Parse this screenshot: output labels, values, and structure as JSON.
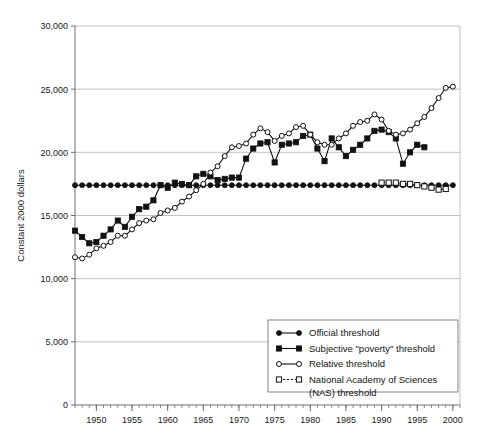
{
  "chart_data": {
    "type": "line",
    "title": "",
    "xlabel": "",
    "ylabel": "Constant 2000 dollars",
    "xlim": [
      1947,
      2001
    ],
    "ylim": [
      0,
      30000
    ],
    "grid": true,
    "legend_position": "bottom-right",
    "y_ticks": [
      0,
      5000,
      10000,
      15000,
      20000,
      25000,
      30000
    ],
    "y_tick_labels": [
      "0",
      "5,000",
      "10,000",
      "15,000",
      "20,000",
      "25,000",
      "30,000"
    ],
    "x_ticks": [
      1950,
      1955,
      1960,
      1965,
      1970,
      1975,
      1980,
      1985,
      1990,
      1995,
      2000
    ],
    "x_tick_labels": [
      "1950",
      "1955",
      "1960",
      "1965",
      "1970",
      "1975",
      "1980",
      "1985",
      "1990",
      "1995",
      "2000"
    ],
    "x_minor_tick_step": 1,
    "series": [
      {
        "name": "Official threshold",
        "marker": "filled-circle",
        "line_style": "solid",
        "color": "#111111",
        "x": [
          1947,
          1948,
          1949,
          1950,
          1951,
          1952,
          1953,
          1954,
          1955,
          1956,
          1957,
          1958,
          1959,
          1960,
          1961,
          1962,
          1963,
          1964,
          1965,
          1966,
          1967,
          1968,
          1969,
          1970,
          1971,
          1972,
          1973,
          1974,
          1975,
          1976,
          1977,
          1978,
          1979,
          1980,
          1981,
          1982,
          1983,
          1984,
          1985,
          1986,
          1987,
          1988,
          1989,
          1990,
          1991,
          1992,
          1993,
          1994,
          1995,
          1996,
          1997,
          1998,
          1999,
          2000
        ],
        "y": [
          17400,
          17400,
          17400,
          17400,
          17400,
          17400,
          17400,
          17400,
          17400,
          17400,
          17400,
          17400,
          17400,
          17400,
          17400,
          17400,
          17400,
          17400,
          17400,
          17400,
          17400,
          17400,
          17400,
          17400,
          17400,
          17400,
          17400,
          17400,
          17400,
          17400,
          17400,
          17400,
          17400,
          17400,
          17400,
          17400,
          17400,
          17400,
          17400,
          17400,
          17400,
          17400,
          17400,
          17400,
          17400,
          17400,
          17400,
          17400,
          17400,
          17400,
          17400,
          17400,
          17400,
          17400
        ]
      },
      {
        "name": "Subjective \"poverty\" threshold",
        "marker": "filled-square",
        "line_style": "solid",
        "color": "#111111",
        "x": [
          1947,
          1948,
          1949,
          1950,
          1951,
          1952,
          1953,
          1954,
          1955,
          1956,
          1957,
          1958,
          1959,
          1960,
          1961,
          1962,
          1963,
          1964,
          1965,
          1966,
          1967,
          1968,
          1969,
          1970,
          1971,
          1972,
          1973,
          1974,
          1975,
          1976,
          1977,
          1978,
          1979,
          1980,
          1981,
          1982,
          1983,
          1984,
          1985,
          1986,
          1987,
          1988,
          1989,
          1990,
          1991,
          1992,
          1993,
          1994,
          1995,
          1996
        ],
        "y": [
          13800,
          13300,
          12800,
          12900,
          13400,
          13900,
          14600,
          14100,
          14900,
          15500,
          15700,
          16200,
          17400,
          17200,
          17600,
          17500,
          17400,
          18100,
          18300,
          18100,
          17800,
          17900,
          18000,
          18000,
          19500,
          20300,
          20700,
          20800,
          19200,
          20600,
          20700,
          20800,
          21300,
          21400,
          20300,
          19300,
          21100,
          20400,
          19700,
          20200,
          20600,
          21100,
          21700,
          21800,
          21600,
          21100,
          19100,
          20000,
          20600,
          20400
        ]
      },
      {
        "name": "Relative threshold",
        "marker": "open-circle",
        "line_style": "solid",
        "color": "#111111",
        "x": [
          1947,
          1948,
          1949,
          1950,
          1951,
          1952,
          1953,
          1954,
          1955,
          1956,
          1957,
          1958,
          1959,
          1960,
          1961,
          1962,
          1963,
          1964,
          1965,
          1966,
          1967,
          1968,
          1969,
          1970,
          1971,
          1972,
          1973,
          1974,
          1975,
          1976,
          1977,
          1978,
          1979,
          1980,
          1981,
          1982,
          1983,
          1984,
          1985,
          1986,
          1987,
          1988,
          1989,
          1990,
          1991,
          1992,
          1993,
          1994,
          1995,
          1996,
          1997,
          1998,
          1999,
          2000
        ],
        "y": [
          11700,
          11600,
          11900,
          12400,
          12600,
          12900,
          13400,
          13400,
          13900,
          14400,
          14600,
          14700,
          15200,
          15400,
          15600,
          16100,
          16500,
          17000,
          17500,
          18400,
          18900,
          19700,
          20400,
          20500,
          20700,
          21400,
          21900,
          21600,
          20900,
          21300,
          21500,
          22000,
          22100,
          21400,
          20800,
          20600,
          20600,
          21100,
          21500,
          22100,
          22400,
          22500,
          23000,
          22600,
          21700,
          21400,
          21500,
          21800,
          22300,
          22800,
          23500,
          24300,
          25100,
          25200
        ]
      },
      {
        "name": "National Academy of Sciences (NAS) threshold",
        "marker": "open-square",
        "line_style": "dashed",
        "color": "#111111",
        "x": [
          1990,
          1991,
          1992,
          1993,
          1994,
          1995,
          1996,
          1997,
          1998,
          1999
        ],
        "y": [
          17600,
          17600,
          17600,
          17500,
          17500,
          17400,
          17300,
          17200,
          17050,
          17100
        ]
      }
    ],
    "legend": [
      {
        "label": "Official threshold",
        "marker": "filled-circle",
        "line_style": "solid"
      },
      {
        "label": "Subjective \"poverty\" threshold",
        "marker": "filled-square",
        "line_style": "solid"
      },
      {
        "label": "Relative threshold",
        "marker": "open-circle",
        "line_style": "solid"
      },
      {
        "label": "National Academy of Sciences",
        "label_line2": "(NAS) threshold",
        "marker": "open-square",
        "line_style": "dashed"
      }
    ]
  }
}
